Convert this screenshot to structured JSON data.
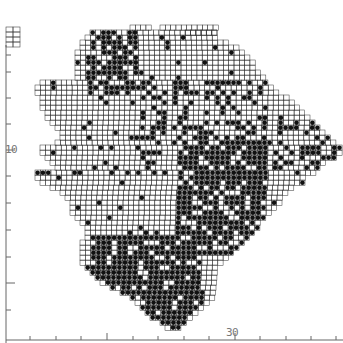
{
  "map": {
    "type": "grid distribution map",
    "grid_cell_px": 5.3,
    "colors": {
      "grid": "#333333",
      "dot": "#111111",
      "axis": "#555555",
      "background": "#ffffff"
    },
    "axes": {
      "left_label": "10",
      "bottom_label": "30",
      "left_ticks_y": [
        55,
        72,
        98,
        124,
        150,
        176,
        203,
        230,
        257,
        283,
        310
      ],
      "bottom_ticks_x": [
        30,
        56,
        81,
        107,
        133,
        158,
        184,
        209,
        235,
        260,
        286,
        311,
        336
      ]
    },
    "inset_box": {
      "x": 6,
      "y": 27,
      "w": 14,
      "h": 20
    },
    "rows": [
      [
        30,
        185,
        215
      ],
      [
        25,
        130,
        150
      ],
      [
        25,
        160,
        215
      ],
      [
        30,
        90,
        215
      ],
      [
        35,
        85,
        215
      ],
      [
        40,
        80,
        225
      ],
      [
        45,
        80,
        235
      ],
      [
        50,
        75,
        240
      ],
      [
        55,
        75,
        245
      ],
      [
        60,
        75,
        250
      ],
      [
        65,
        75,
        255
      ],
      [
        70,
        75,
        260
      ],
      [
        75,
        75,
        265
      ],
      [
        80,
        40,
        265
      ],
      [
        85,
        35,
        270
      ],
      [
        90,
        35,
        275
      ],
      [
        95,
        40,
        285
      ],
      [
        100,
        40,
        290
      ],
      [
        105,
        40,
        295
      ],
      [
        110,
        45,
        300
      ],
      [
        115,
        45,
        310
      ],
      [
        120,
        50,
        315
      ],
      [
        125,
        55,
        320
      ],
      [
        130,
        60,
        325
      ],
      [
        135,
        60,
        330
      ],
      [
        140,
        55,
        335
      ],
      [
        145,
        40,
        340
      ],
      [
        150,
        40,
        340
      ],
      [
        155,
        45,
        335
      ],
      [
        160,
        50,
        325
      ],
      [
        165,
        55,
        320
      ],
      [
        170,
        35,
        315
      ],
      [
        175,
        35,
        305
      ],
      [
        180,
        40,
        300
      ],
      [
        185,
        50,
        290
      ],
      [
        190,
        60,
        285
      ],
      [
        195,
        65,
        280
      ],
      [
        200,
        70,
        280
      ],
      [
        205,
        70,
        275
      ],
      [
        210,
        70,
        270
      ],
      [
        215,
        75,
        265
      ],
      [
        220,
        80,
        260
      ],
      [
        225,
        85,
        255
      ],
      [
        230,
        85,
        250
      ],
      [
        235,
        85,
        245
      ],
      [
        240,
        80,
        240
      ],
      [
        245,
        80,
        235
      ],
      [
        250,
        80,
        230
      ],
      [
        255,
        80,
        225
      ],
      [
        260,
        80,
        220
      ],
      [
        265,
        85,
        215
      ],
      [
        270,
        90,
        215
      ],
      [
        275,
        95,
        215
      ],
      [
        280,
        100,
        215
      ],
      [
        285,
        110,
        215
      ],
      [
        290,
        120,
        215
      ],
      [
        295,
        130,
        210
      ],
      [
        300,
        135,
        205
      ],
      [
        305,
        140,
        200
      ],
      [
        310,
        145,
        195
      ],
      [
        315,
        150,
        190
      ],
      [
        320,
        160,
        185
      ],
      [
        325,
        165,
        180
      ]
    ],
    "dense_regions": [
      {
        "x": 85,
        "y": 30,
        "w": 50,
        "h": 60,
        "density": 0.65
      },
      {
        "x": 175,
        "y": 140,
        "w": 90,
        "h": 110,
        "density": 0.75
      },
      {
        "x": 90,
        "y": 235,
        "w": 110,
        "h": 60,
        "density": 0.8
      },
      {
        "x": 140,
        "y": 285,
        "w": 60,
        "h": 45,
        "density": 0.85
      },
      {
        "x": 260,
        "y": 120,
        "w": 80,
        "h": 45,
        "density": 0.45
      },
      {
        "x": 130,
        "y": 80,
        "w": 140,
        "h": 70,
        "density": 0.3
      }
    ],
    "sparse_density": 0.07
  }
}
